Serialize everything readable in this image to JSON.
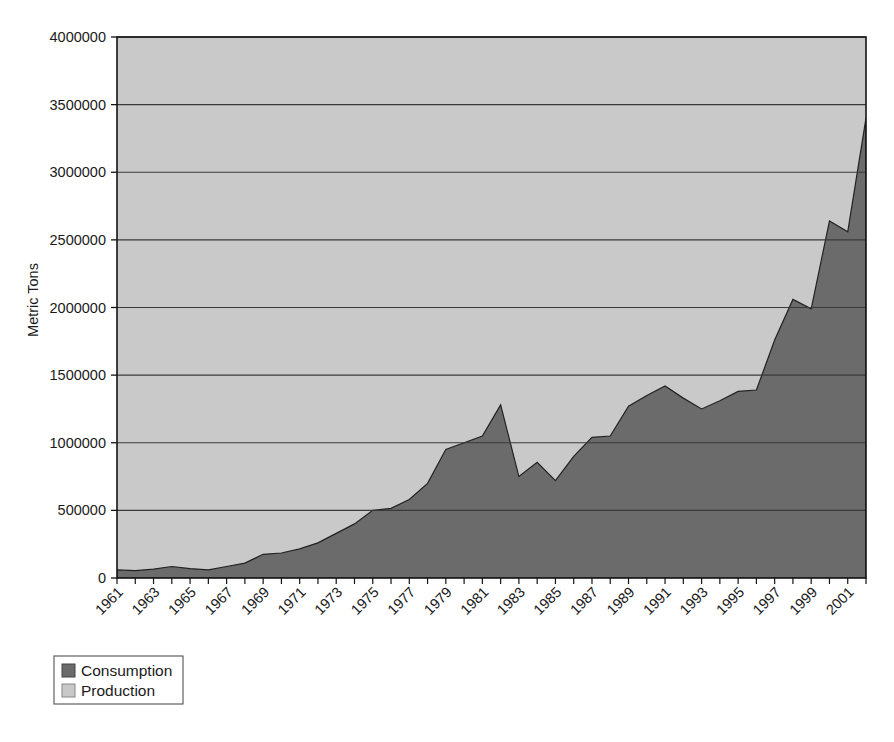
{
  "chart_data": {
    "type": "area",
    "title": "",
    "subtitle": "",
    "xlabel": "",
    "ylabel": "Metric Tons",
    "ylim": [
      0,
      4000000
    ],
    "ytick_labels": [
      "0",
      "500000",
      "1000000",
      "1500000",
      "2000000",
      "2500000",
      "3000000",
      "3500000",
      "4000000"
    ],
    "ytick_values": [
      0,
      500000,
      1000000,
      1500000,
      2000000,
      2500000,
      3000000,
      3500000,
      4000000
    ],
    "grid": true,
    "legend_position": "bottom-left",
    "stacked": false,
    "x": [
      1961,
      1962,
      1963,
      1964,
      1965,
      1966,
      1967,
      1968,
      1969,
      1970,
      1971,
      1972,
      1973,
      1974,
      1975,
      1976,
      1977,
      1978,
      1979,
      1980,
      1981,
      1982,
      1983,
      1984,
      1985,
      1986,
      1987,
      1988,
      1989,
      1990,
      1991,
      1992,
      1993,
      1994,
      1995,
      1996,
      1997,
      1998,
      1999,
      2000,
      2001,
      2002
    ],
    "xtick_labels": [
      "1961",
      "1963",
      "1965",
      "1967",
      "1969",
      "1971",
      "1973",
      "1975",
      "1977",
      "1979",
      "1981",
      "1983",
      "1985",
      "1987",
      "1989",
      "1991",
      "1993",
      "1995",
      "1997",
      "1999",
      "2001"
    ],
    "xlim": [
      1961,
      2002
    ],
    "series": [
      {
        "name": "Consumption",
        "color": "#6b6b6b",
        "values": [
          60000,
          55000,
          65000,
          85000,
          70000,
          60000,
          85000,
          110000,
          175000,
          185000,
          215000,
          260000,
          330000,
          400000,
          500000,
          515000,
          580000,
          700000,
          950000,
          1000000,
          1050000,
          1280000,
          750000,
          855000,
          720000,
          900000,
          1040000,
          1050000,
          1270000,
          1350000,
          1420000,
          1330000,
          1250000,
          1310000,
          1380000,
          1390000,
          1760000,
          2060000,
          1990000,
          2640000,
          2560000,
          3400000
        ]
      },
      {
        "name": "Production",
        "color": "#c8c8c8",
        "values": [
          0,
          0,
          0,
          0,
          0,
          0,
          0,
          0,
          0,
          0,
          0,
          0,
          0,
          0,
          0,
          0,
          0,
          0,
          0,
          0,
          0,
          0,
          0,
          0,
          0,
          0,
          10000,
          40000,
          70000,
          105000,
          80000,
          95000,
          90000,
          90000,
          145000,
          185000,
          195000,
          250000,
          270000,
          300000,
          305000,
          320000
        ]
      }
    ]
  },
  "legend": {
    "items": [
      {
        "label": "Consumption",
        "color": "#6b6b6b"
      },
      {
        "label": "Production",
        "color": "#c8c8c8"
      }
    ]
  },
  "axes": {
    "y_title": "Metric Tons"
  }
}
